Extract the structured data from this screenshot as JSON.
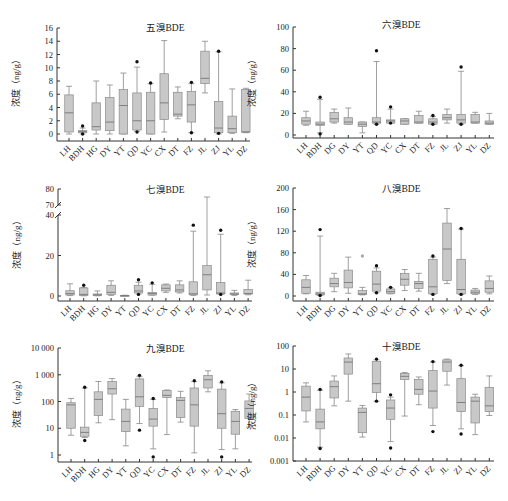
{
  "figure": {
    "caption": ""
  },
  "chart_data": [
    {
      "type": "box",
      "title": "五溴BDE",
      "ylabel": "浓度（ng/g）",
      "xlabel": "",
      "yscale": "linear",
      "ylim": [
        0,
        16
      ],
      "yticks": [
        0,
        2,
        4,
        6,
        8,
        10,
        12,
        14,
        16
      ],
      "categories": [
        "LH",
        "BDH",
        "HG",
        "DY",
        "YT",
        "QD",
        "YC",
        "CX",
        "DT",
        "FZ",
        "JL",
        "ZJ",
        "YL",
        "DZ"
      ],
      "boxes": [
        {
          "min": 0.0,
          "q1": 0.3,
          "median": 3.2,
          "q3": 5.9,
          "max": 7.2,
          "outliers": []
        },
        {
          "min": 0.0,
          "q1": 0.2,
          "median": 0.4,
          "q3": 0.5,
          "max": 0.9,
          "outliers": [
            1.2,
            0.0
          ]
        },
        {
          "min": 0.0,
          "q1": 0.6,
          "median": 1.1,
          "q3": 4.7,
          "max": 8.0,
          "outliers": []
        },
        {
          "min": 0.0,
          "q1": 0.5,
          "median": 1.8,
          "q3": 5.5,
          "max": 7.4,
          "outliers": []
        },
        {
          "min": 0.0,
          "q1": 0.0,
          "median": 4.3,
          "q3": 6.7,
          "max": 9.2,
          "outliers": []
        },
        {
          "min": 0.4,
          "q1": 0.6,
          "median": 2.0,
          "q3": 6.2,
          "max": 10.1,
          "outliers": [
            10.9,
            0.3
          ]
        },
        {
          "min": 0.0,
          "q1": 0.0,
          "median": 2.0,
          "q3": 6.3,
          "max": 7.6,
          "outliers": [
            7.7
          ]
        },
        {
          "min": 0.3,
          "q1": 2.2,
          "median": 4.7,
          "q3": 9.1,
          "max": 14.1,
          "outliers": []
        },
        {
          "min": 2.3,
          "q1": 2.7,
          "median": 3.0,
          "q3": 6.3,
          "max": 7.1,
          "outliers": []
        },
        {
          "min": 0.2,
          "q1": 1.8,
          "median": 4.4,
          "q3": 6.4,
          "max": 7.6,
          "outliers": [
            7.8,
            0.2
          ]
        },
        {
          "min": 6.2,
          "q1": 7.6,
          "median": 8.4,
          "q3": 12.5,
          "max": 14.0,
          "outliers": []
        },
        {
          "min": 0.0,
          "q1": 0.2,
          "median": 0.9,
          "q3": 4.9,
          "max": 12.4,
          "outliers": [
            12.5,
            0.1
          ]
        },
        {
          "min": 0.1,
          "q1": 0.2,
          "median": 0.8,
          "q3": 2.7,
          "max": 6.8,
          "outliers": []
        },
        {
          "min": 0.2,
          "q1": 0.3,
          "median": 0.3,
          "q3": 6.7,
          "max": 6.9,
          "outliers": []
        }
      ]
    },
    {
      "type": "box",
      "title": "六溴BDE",
      "ylabel": "浓度（ng/g）",
      "xlabel": "",
      "yscale": "linear",
      "ylim": [
        0,
        100
      ],
      "yticks": [
        0,
        20,
        40,
        60,
        80,
        100
      ],
      "categories": [
        "LH",
        "BDH",
        "DG",
        "DY",
        "YT",
        "QD",
        "YC",
        "CX",
        "DT",
        "FZ",
        "JL",
        "ZJ",
        "YL",
        "DZ"
      ],
      "boxes": [
        {
          "min": 9,
          "q1": 10,
          "median": 13,
          "q3": 16,
          "max": 22,
          "outliers": []
        },
        {
          "min": 2,
          "q1": 9,
          "median": 10,
          "q3": 12,
          "max": 33,
          "outliers": [
            35,
            1
          ]
        },
        {
          "min": 11,
          "q1": 12,
          "median": 15,
          "q3": 21,
          "max": 24,
          "outliers": []
        },
        {
          "min": 10,
          "q1": 10,
          "median": 12,
          "q3": 16,
          "max": 25,
          "outliers": []
        },
        {
          "min": 2,
          "q1": 8,
          "median": 10,
          "q3": 12,
          "max": 12,
          "outliers": []
        },
        {
          "min": 10,
          "q1": 11,
          "median": 12,
          "q3": 16,
          "max": 68,
          "outliers": [
            78,
            10
          ]
        },
        {
          "min": 11,
          "q1": 11,
          "median": 13,
          "q3": 14,
          "max": 24,
          "outliers": [
            26,
            11
          ]
        },
        {
          "min": 10,
          "q1": 10,
          "median": 13,
          "q3": 15,
          "max": 15,
          "outliers": []
        },
        {
          "min": 11,
          "q1": 11,
          "median": 12,
          "q3": 18,
          "max": 22,
          "outliers": []
        },
        {
          "min": 10,
          "q1": 10,
          "median": 12,
          "q3": 15,
          "max": 17,
          "outliers": [
            18,
            10
          ]
        },
        {
          "min": 11,
          "q1": 14,
          "median": 16,
          "q3": 19,
          "max": 24,
          "outliers": []
        },
        {
          "min": 10,
          "q1": 11,
          "median": 14,
          "q3": 19,
          "max": 59,
          "outliers": [
            63,
            10
          ]
        },
        {
          "min": 11,
          "q1": 11,
          "median": 12,
          "q3": 19,
          "max": 21,
          "outliers": []
        },
        {
          "min": 10,
          "q1": 10,
          "median": 11,
          "q3": 13,
          "max": 20,
          "outliers": []
        }
      ]
    },
    {
      "type": "box",
      "title": "七溴BDE",
      "ylabel": "浓度（ng/g）",
      "xlabel": "",
      "yscale": "linear-broken",
      "ylim": [
        0,
        80
      ],
      "axis_break": [
        40,
        70
      ],
      "yticks": [
        0,
        20,
        40,
        70,
        80
      ],
      "categories": [
        "LH",
        "BDH",
        "HG",
        "DY",
        "YT",
        "QD",
        "YC",
        "CX",
        "DT",
        "FZ",
        "JL",
        "ZJ",
        "YL",
        "DZ"
      ],
      "boxes": [
        {
          "min": 0.2,
          "q1": 0.5,
          "median": 1.2,
          "q3": 2.6,
          "max": 6.0,
          "outliers": []
        },
        {
          "min": 0.1,
          "q1": 0.3,
          "median": 0.8,
          "q3": 4.0,
          "max": 4.2,
          "outliers": [
            5.3
          ]
        },
        {
          "min": 0.1,
          "q1": 0.3,
          "median": 0.6,
          "q3": 1.0,
          "max": 2.5,
          "outliers": []
        },
        {
          "min": 0.3,
          "q1": 0.8,
          "median": 1.8,
          "q3": 5.3,
          "max": 7.5,
          "outliers": []
        },
        {
          "min": 0.0,
          "q1": 0.1,
          "median": 0.2,
          "q3": 0.3,
          "max": 0.4,
          "outliers": []
        },
        {
          "min": 1.0,
          "q1": 1.5,
          "median": 2.5,
          "q3": 5.3,
          "max": 6.8,
          "outliers": [
            8.0,
            0.8
          ]
        },
        {
          "min": 0.4,
          "q1": 0.5,
          "median": 1.2,
          "q3": 1.8,
          "max": 5.8,
          "outliers": [
            6.5
          ]
        },
        {
          "min": 1.8,
          "q1": 2.5,
          "median": 3.8,
          "q3": 5.5,
          "max": 5.9,
          "outliers": []
        },
        {
          "min": 1.5,
          "q1": 2.0,
          "median": 3.0,
          "q3": 5.5,
          "max": 7.5,
          "outliers": []
        },
        {
          "min": 0.3,
          "q1": 0.6,
          "median": 1.1,
          "q3": 7.0,
          "max": 32.0,
          "outliers": [
            35.0
          ]
        },
        {
          "min": 0.5,
          "q1": 3.0,
          "median": 10.5,
          "q3": 15.0,
          "max": 75.0,
          "outliers": []
        },
        {
          "min": 0.8,
          "q1": 1.0,
          "median": 1.5,
          "q3": 6.6,
          "max": 30.5,
          "outliers": [
            32.5,
            0.8
          ]
        },
        {
          "min": 0.3,
          "q1": 0.7,
          "median": 1.0,
          "q3": 1.5,
          "max": 2.8,
          "outliers": []
        },
        {
          "min": 0.6,
          "q1": 1.0,
          "median": 1.2,
          "q3": 3.2,
          "max": 7.8,
          "outliers": []
        }
      ]
    },
    {
      "type": "box",
      "title": "八溴BDE",
      "ylabel": "浓度（ng/g）",
      "xlabel": "",
      "yscale": "linear",
      "ylim": [
        0,
        200
      ],
      "yticks": [
        0,
        40,
        80,
        120,
        160,
        200
      ],
      "categories": [
        "LH",
        "BDH",
        "DG",
        "DY",
        "YT",
        "QD",
        "YC",
        "CX",
        "DT",
        "FZ",
        "JL",
        "ZJ",
        "YL",
        "DZ"
      ],
      "boxes": [
        {
          "min": 4,
          "q1": 5,
          "median": 16,
          "q3": 30,
          "max": 38,
          "outliers": []
        },
        {
          "min": 1,
          "q1": 2,
          "median": 4,
          "q3": 7,
          "max": 111,
          "outliers": [
            123,
            1
          ]
        },
        {
          "min": 8,
          "q1": 17,
          "median": 23,
          "q3": 33,
          "max": 42,
          "outliers": []
        },
        {
          "min": 5,
          "q1": 15,
          "median": 25,
          "q3": 48,
          "max": 72,
          "outliers": []
        },
        {
          "min": 2,
          "q1": 3,
          "median": 4,
          "q3": 10,
          "max": 16,
          "outliers": [
            74
          ]
        },
        {
          "min": 6,
          "q1": 9,
          "median": 22,
          "q3": 46,
          "max": 52,
          "outliers": [
            56,
            6
          ]
        },
        {
          "min": 4,
          "q1": 5,
          "median": 8,
          "q3": 13,
          "max": 15,
          "outliers": [
            16
          ]
        },
        {
          "min": 10,
          "q1": 20,
          "median": 31,
          "q3": 42,
          "max": 49,
          "outliers": []
        },
        {
          "min": 9,
          "q1": 14,
          "median": 23,
          "q3": 27,
          "max": 42,
          "outliers": []
        },
        {
          "min": 3,
          "q1": 4,
          "median": 17,
          "q3": 68,
          "max": 72,
          "outliers": [
            74,
            3
          ]
        },
        {
          "min": 23,
          "q1": 29,
          "median": 87,
          "q3": 135,
          "max": 162,
          "outliers": []
        },
        {
          "min": 3,
          "q1": 4,
          "median": 12,
          "q3": 68,
          "max": 124,
          "outliers": [
            125,
            3
          ]
        },
        {
          "min": 3,
          "q1": 4,
          "median": 7,
          "q3": 11,
          "max": 14,
          "outliers": []
        },
        {
          "min": 4,
          "q1": 7,
          "median": 14,
          "q3": 28,
          "max": 37,
          "outliers": []
        }
      ]
    },
    {
      "type": "box",
      "title": "九溴BDE",
      "ylabel": "浓度（ng/g）",
      "xlabel": "",
      "yscale": "log",
      "ylim": [
        1,
        10000
      ],
      "yticks": [
        1,
        10,
        100,
        1000,
        10000
      ],
      "ytick_labels": [
        "1",
        "10",
        "100",
        "1 000",
        "10 000"
      ],
      "categories": [
        "LH",
        "BDH",
        "HG",
        "DY",
        "YT",
        "QD",
        "YC",
        "CX",
        "DT",
        "FZ",
        "JL",
        "ZJ",
        "YL",
        "DZ"
      ],
      "boxes": [
        {
          "min": 5.5,
          "q1": 10,
          "median": 75,
          "q3": 90,
          "max": 130,
          "outliers": []
        },
        {
          "min": 4.5,
          "q1": 5,
          "median": 7,
          "q3": 11,
          "max": 320,
          "outliers": [
            340,
            3.5
          ]
        },
        {
          "min": 16,
          "q1": 30,
          "median": 120,
          "q3": 230,
          "max": 560,
          "outliers": []
        },
        {
          "min": 21,
          "q1": 190,
          "median": 300,
          "q3": 560,
          "max": 720,
          "outliers": []
        },
        {
          "min": 2.2,
          "q1": 7.5,
          "median": 18,
          "q3": 52,
          "max": 120,
          "outliers": []
        },
        {
          "min": 15,
          "q1": 65,
          "median": 150,
          "q3": 700,
          "max": 850,
          "outliers": [
            950,
            8.5
          ]
        },
        {
          "min": 1.7,
          "q1": 12,
          "median": 22,
          "q3": 55,
          "max": 120,
          "outliers": [
            130,
            0.85
          ]
        },
        {
          "min": 5.8,
          "q1": 140,
          "median": 170,
          "q3": 260,
          "max": 270,
          "outliers": []
        },
        {
          "min": 17,
          "q1": 25,
          "median": 110,
          "q3": 140,
          "max": 240,
          "outliers": []
        },
        {
          "min": 1.2,
          "q1": 12,
          "median": 75,
          "q3": 320,
          "max": 560,
          "outliers": [
            600
          ]
        },
        {
          "min": 230,
          "q1": 320,
          "median": 650,
          "q3": 950,
          "max": 1400,
          "outliers": []
        },
        {
          "min": 1.6,
          "q1": 10,
          "median": 35,
          "q3": 290,
          "max": 500,
          "outliers": [
            540,
            0.85
          ]
        },
        {
          "min": 1.7,
          "q1": 6,
          "median": 18,
          "q3": 43,
          "max": 50,
          "outliers": []
        },
        {
          "min": 11,
          "q1": 23,
          "median": 55,
          "q3": 105,
          "max": 190,
          "outliers": []
        }
      ]
    },
    {
      "type": "box",
      "title": "十溴BDE",
      "ylabel": "浓度（ng/g）",
      "xlabel": "",
      "yscale": "log",
      "ylim": [
        0.001,
        100
      ],
      "yticks": [
        0.001,
        0.01,
        0.1,
        1,
        10,
        100
      ],
      "ytick_labels": [
        "0.001",
        "0.01",
        "0.1",
        "1",
        "10",
        "100"
      ],
      "categories": [
        "LH",
        "BDH",
        "DG",
        "DY",
        "YT",
        "QD",
        "YC",
        "CX",
        "DT",
        "FZ",
        "JL",
        "ZJ",
        "YL",
        "DZ"
      ],
      "boxes": [
        {
          "min": 0.05,
          "q1": 0.15,
          "median": 0.6,
          "q3": 1.8,
          "max": 2.5,
          "outliers": []
        },
        {
          "min": 0.004,
          "q1": 0.025,
          "median": 0.05,
          "q3": 0.18,
          "max": 1.2,
          "outliers": [
            1.3,
            0.0035
          ]
        },
        {
          "min": 0.25,
          "q1": 0.55,
          "median": 1.7,
          "q3": 3.0,
          "max": 5.0,
          "outliers": []
        },
        {
          "min": 0.4,
          "q1": 6,
          "median": 20,
          "q3": 30,
          "max": 45,
          "outliers": []
        },
        {
          "min": 0.011,
          "q1": 0.017,
          "median": 0.13,
          "q3": 0.2,
          "max": 0.26,
          "outliers": []
        },
        {
          "min": 0.4,
          "q1": 0.95,
          "median": 2.3,
          "q3": 21,
          "max": 25,
          "outliers": [
            27,
            0.4
          ]
        },
        {
          "min": 0.007,
          "q1": 0.065,
          "median": 0.2,
          "q3": 0.45,
          "max": 0.6,
          "outliers": [
            0.75,
            0.0037
          ]
        },
        {
          "min": 0.09,
          "q1": 3.5,
          "median": 4.8,
          "q3": 6.5,
          "max": 7,
          "outliers": []
        },
        {
          "min": 0.28,
          "q1": 0.8,
          "median": 1.3,
          "q3": 3.5,
          "max": 4.5,
          "outliers": []
        },
        {
          "min": 0.035,
          "q1": 0.2,
          "median": 1.1,
          "q3": 8.5,
          "max": 20,
          "outliers": [
            21,
            0.019
          ]
        },
        {
          "min": 2,
          "q1": 8,
          "median": 20,
          "q3": 25,
          "max": 27,
          "outliers": []
        },
        {
          "min": 0.025,
          "q1": 0.14,
          "median": 0.35,
          "q3": 3.8,
          "max": 14,
          "outliers": [
            14.5,
            0.015
          ]
        },
        {
          "min": 0.014,
          "q1": 0.045,
          "median": 0.4,
          "q3": 0.6,
          "max": 0.8,
          "outliers": []
        },
        {
          "min": 0.095,
          "q1": 0.14,
          "median": 0.25,
          "q3": 1.6,
          "max": 5,
          "outliers": []
        }
      ]
    }
  ]
}
